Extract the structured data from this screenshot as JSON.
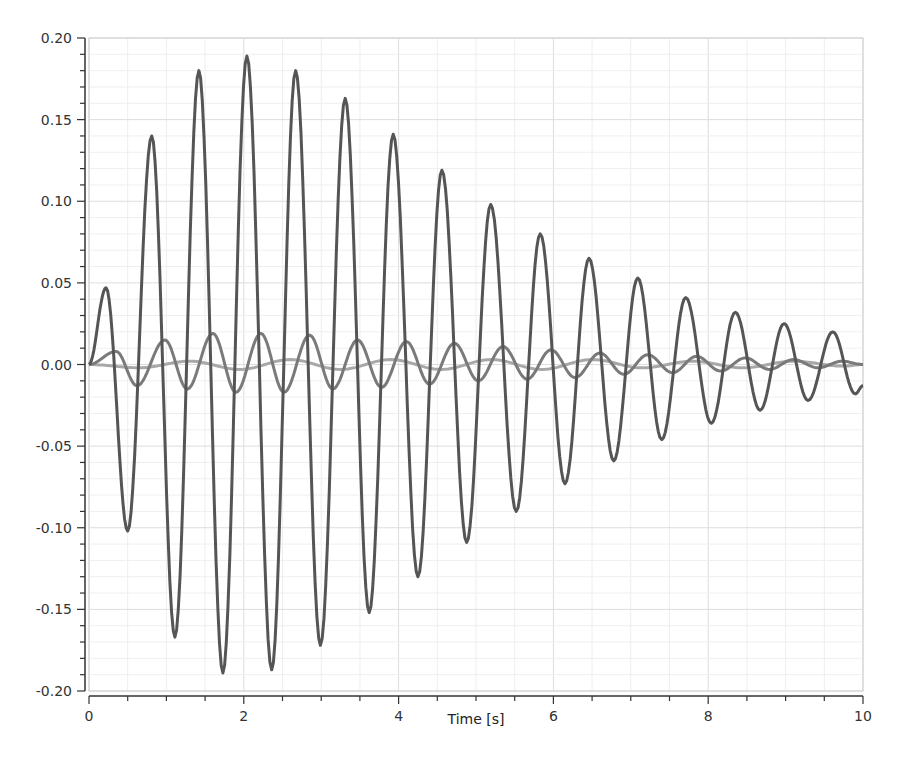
{
  "chart_data": {
    "type": "line",
    "title": "",
    "xlabel": "Time [s]",
    "ylabel": "",
    "xlim": [
      0,
      10
    ],
    "ylim": [
      -0.2,
      0.2
    ],
    "grid": true,
    "legend": null,
    "x_ticks": [
      0,
      2,
      4,
      6,
      8,
      10
    ],
    "x_tick_labels": [
      "0",
      "2",
      "4",
      "6",
      "8",
      "10"
    ],
    "y_ticks": [
      0.2,
      0.15,
      0.1,
      0.05,
      0.0,
      -0.05,
      -0.1,
      -0.15,
      -0.2
    ],
    "y_tick_labels": [
      "0.20",
      "0.15",
      "0.10",
      "0.05",
      "0.00",
      "-0.05",
      "-0.10",
      "-0.15",
      "-0.20"
    ],
    "series": [
      {
        "name": "series-1 (large oscillation)",
        "color": "#555555",
        "width": 3,
        "x": [
          0,
          0.22,
          0.5,
          0.81,
          1.11,
          1.42,
          1.73,
          2.04,
          2.36,
          2.67,
          2.99,
          3.31,
          3.62,
          3.93,
          4.25,
          4.56,
          4.88,
          5.19,
          5.52,
          5.83,
          6.15,
          6.46,
          6.78,
          7.09,
          7.4,
          7.71,
          8.04,
          8.35,
          8.67,
          8.98,
          9.29,
          9.61,
          9.9,
          10.0
        ],
        "y": [
          0,
          0.047,
          -0.102,
          0.14,
          -0.167,
          0.18,
          -0.189,
          0.189,
          -0.187,
          0.18,
          -0.172,
          0.163,
          -0.152,
          0.141,
          -0.13,
          0.119,
          -0.109,
          0.098,
          -0.09,
          0.08,
          -0.073,
          0.065,
          -0.059,
          0.053,
          -0.046,
          0.041,
          -0.036,
          0.032,
          -0.028,
          0.025,
          -0.022,
          0.02,
          -0.018,
          -0.013
        ]
      },
      {
        "name": "series-2 (medium oscillation)",
        "color": "#7a7a7a",
        "width": 3,
        "x": [
          0,
          0.35,
          0.62,
          0.98,
          1.27,
          1.6,
          1.9,
          2.22,
          2.52,
          2.85,
          3.15,
          3.47,
          3.78,
          4.1,
          4.4,
          4.72,
          5.03,
          5.35,
          5.66,
          5.97,
          6.28,
          6.6,
          6.91,
          7.22,
          7.54,
          7.85,
          8.16,
          8.48,
          8.79,
          9.1,
          9.42,
          9.73,
          10.0
        ],
        "y": [
          0,
          0.008,
          -0.013,
          0.015,
          -0.015,
          0.019,
          -0.017,
          0.019,
          -0.017,
          0.018,
          -0.015,
          0.015,
          -0.014,
          0.014,
          -0.012,
          0.013,
          -0.01,
          0.011,
          -0.009,
          0.009,
          -0.008,
          0.007,
          -0.006,
          0.006,
          -0.005,
          0.005,
          -0.004,
          0.004,
          -0.003,
          0.003,
          -0.002,
          0.002,
          0.0
        ]
      },
      {
        "name": "series-3 (small oscillation)",
        "color": "#a8a8a8",
        "width": 3,
        "x": [
          0,
          0.65,
          1.3,
          1.95,
          2.6,
          3.25,
          3.9,
          4.55,
          5.2,
          5.85,
          6.5,
          7.15,
          7.8,
          8.45,
          9.1,
          9.75,
          10.0
        ],
        "y": [
          0,
          -0.002,
          0.002,
          -0.003,
          0.003,
          -0.003,
          0.003,
          -0.003,
          0.003,
          -0.003,
          0.003,
          -0.002,
          0.002,
          -0.002,
          0.002,
          -0.001,
          0.0
        ]
      }
    ]
  },
  "axes": {
    "x_title": "Time [s]"
  }
}
